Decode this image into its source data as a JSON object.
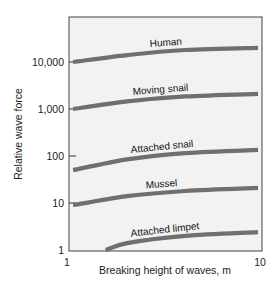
{
  "chart_data": {
    "type": "line",
    "title": "",
    "xlabel": "Breaking height of waves, m",
    "ylabel": "Relative wave force",
    "x_scale": "log",
    "y_scale": "log",
    "xlim": [
      1,
      10
    ],
    "ylim": [
      1,
      40000
    ],
    "x_ticks": [
      {
        "value": 1,
        "label": "1"
      },
      {
        "value": 10,
        "label": "10"
      }
    ],
    "y_ticks": [
      {
        "value": 1,
        "label": "1"
      },
      {
        "value": 10,
        "label": "10"
      },
      {
        "value": 100,
        "label": "100"
      },
      {
        "value": 1000,
        "label": "1,000"
      },
      {
        "value": 10000,
        "label": "10,000"
      }
    ],
    "grid": false,
    "legend": "inline labels above each curve",
    "series": [
      {
        "name": "Human",
        "x": [
          1.05,
          2,
          4,
          10
        ],
        "values": [
          10000,
          14000,
          18000,
          20000
        ]
      },
      {
        "name": "Moving snail",
        "x": [
          1.05,
          2,
          4,
          10
        ],
        "values": [
          1000,
          1450,
          1850,
          2100
        ]
      },
      {
        "name": "Attached snail",
        "x": [
          1.05,
          2,
          4,
          10
        ],
        "values": [
          50,
          85,
          115,
          135
        ]
      },
      {
        "name": "Mussel",
        "x": [
          1.05,
          2,
          4,
          10
        ],
        "values": [
          9,
          14,
          18,
          21
        ]
      },
      {
        "name": "Attached limpet",
        "x": [
          1.55,
          2,
          4,
          10
        ],
        "values": [
          1,
          1.4,
          2.0,
          2.4
        ]
      }
    ],
    "colors": {
      "curve": "#6f6f6f",
      "plot_background": "#f2f2f2",
      "frame": "#444444"
    }
  }
}
